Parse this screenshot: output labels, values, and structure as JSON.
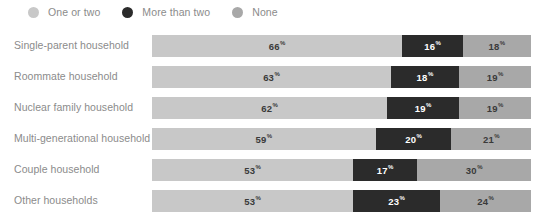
{
  "legend": {
    "items": [
      {
        "label": "One or two",
        "color": "#c8c8c8",
        "icon": "circle-icon"
      },
      {
        "label": "More than two",
        "color": "#2b2b2b",
        "icon": "circle-icon"
      },
      {
        "label": "None",
        "color": "#a8a8a8",
        "icon": "circle-icon"
      }
    ]
  },
  "rows": [
    {
      "label": "Single-parent household",
      "a": "66",
      "b": "16",
      "c": "18",
      "pct": "%"
    },
    {
      "label": "Roommate household",
      "a": "63",
      "b": "18",
      "c": "19",
      "pct": "%"
    },
    {
      "label": "Nuclear family household",
      "a": "62",
      "b": "19",
      "c": "19",
      "pct": "%"
    },
    {
      "label": "Multi-generational household",
      "a": "59",
      "b": "20",
      "c": "21",
      "pct": "%"
    },
    {
      "label": "Couple household",
      "a": "53",
      "b": "17",
      "c": "30",
      "pct": "%"
    },
    {
      "label": "Other households",
      "a": "53",
      "b": "23",
      "c": "24",
      "pct": "%"
    }
  ],
  "chart_data": {
    "type": "bar",
    "subtype": "stacked-horizontal-100",
    "title": "",
    "xlabel": "",
    "ylabel": "",
    "xlim": [
      0,
      100
    ],
    "grid": false,
    "legend_position": "top-left",
    "value_suffix": "%",
    "categories": [
      "Single-parent household",
      "Roommate household",
      "Nuclear family household",
      "Multi-generational household",
      "Couple household",
      "Other households"
    ],
    "series": [
      {
        "name": "One or two",
        "color": "#c8c8c8",
        "values": [
          66,
          63,
          62,
          59,
          53,
          53
        ]
      },
      {
        "name": "More than two",
        "color": "#2b2b2b",
        "values": [
          16,
          18,
          19,
          20,
          17,
          23
        ]
      },
      {
        "name": "None",
        "color": "#a8a8a8",
        "values": [
          18,
          19,
          19,
          21,
          30,
          24
        ]
      }
    ]
  },
  "colors": {
    "series_one_or_two": "#c8c8c8",
    "series_more_than_two": "#2b2b2b",
    "series_none": "#a8a8a8",
    "label_text": "#8b8b8b",
    "value_dark": "#3a3a3a",
    "value_light": "#ffffff",
    "background": "#ffffff"
  }
}
